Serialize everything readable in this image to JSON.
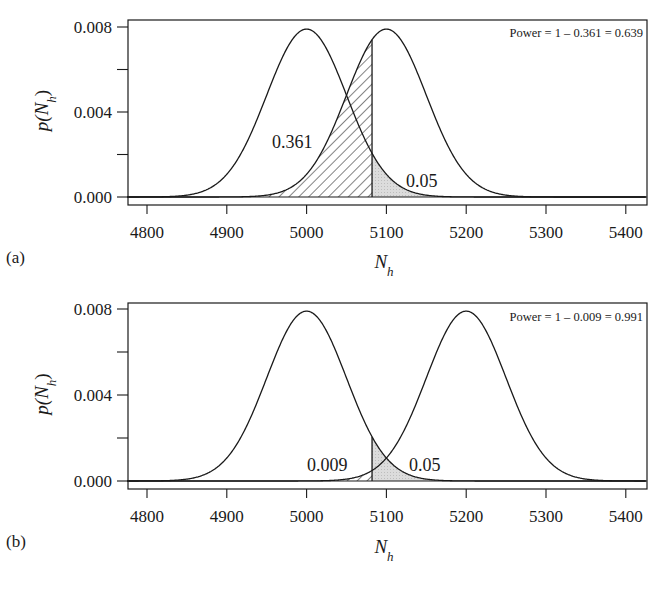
{
  "chart_data": [
    {
      "panel": "a",
      "type": "line",
      "panel_label": "(a)",
      "xlabel": "N_h",
      "xlabel_main": "N",
      "xlabel_sub": "h",
      "ylabel": "p(N_h)",
      "ylabel_main": "p(N",
      "ylabel_sub": "h",
      "ylabel_close": ")",
      "xlim": [
        4775,
        5425
      ],
      "ylim": [
        0.0,
        0.008
      ],
      "xticks": [
        4800,
        4900,
        5000,
        5100,
        5200,
        5300,
        5400
      ],
      "xtick_labels": [
        "4800",
        "4900",
        "5000",
        "5100",
        "5200",
        "5300",
        "5400"
      ],
      "yticks": [
        0.0,
        0.002,
        0.004,
        0.006,
        0.008
      ],
      "ytick_labels": [
        "0.000",
        "",
        "0.004",
        "",
        "0.008"
      ],
      "grid": false,
      "series": [
        {
          "name": "H0 density",
          "distribution": "normal",
          "mean": 5000,
          "sd": 50,
          "peak": 0.0079
        },
        {
          "name": "H1 density",
          "distribution": "normal",
          "mean": 5100,
          "sd": 50,
          "peak": 0.0079
        }
      ],
      "critical_value": 5082,
      "shaded_regions": [
        {
          "name": "beta (type II error)",
          "under": "H1 density",
          "x_from": 4775,
          "x_to": 5082,
          "fill": "hatched",
          "area": 0.361
        },
        {
          "name": "alpha (type I error)",
          "under": "H0 density",
          "x_from": 5082,
          "x_to": 5425,
          "fill": "light-grey-stipple",
          "area": 0.05
        }
      ],
      "annotations": [
        {
          "text": "0.361",
          "x": 5000,
          "y": 0.0026
        },
        {
          "text": "0.05",
          "x": 5130,
          "y": 0.0008
        }
      ],
      "power_text": "Power = 1 – 0.361 = 0.639"
    },
    {
      "panel": "b",
      "type": "line",
      "panel_label": "(b)",
      "xlabel": "N_h",
      "xlabel_main": "N",
      "xlabel_sub": "h",
      "ylabel": "p(N_h)",
      "ylabel_main": "p(N",
      "ylabel_sub": "h",
      "ylabel_close": ")",
      "xlim": [
        4775,
        5425
      ],
      "ylim": [
        0.0,
        0.008
      ],
      "xticks": [
        4800,
        4900,
        5000,
        5100,
        5200,
        5300,
        5400
      ],
      "xtick_labels": [
        "4800",
        "4900",
        "5000",
        "5100",
        "5200",
        "5300",
        "5400"
      ],
      "yticks": [
        0.0,
        0.002,
        0.004,
        0.006,
        0.008
      ],
      "ytick_labels": [
        "0.000",
        "",
        "0.004",
        "",
        "0.008"
      ],
      "grid": false,
      "series": [
        {
          "name": "H0 density",
          "distribution": "normal",
          "mean": 5000,
          "sd": 50,
          "peak": 0.0079
        },
        {
          "name": "H1 density",
          "distribution": "normal",
          "mean": 5200,
          "sd": 50,
          "peak": 0.0079
        }
      ],
      "critical_value": 5082,
      "shaded_regions": [
        {
          "name": "beta (type II error)",
          "under": "H1 density",
          "x_from": 4775,
          "x_to": 5082,
          "fill": "hatched",
          "area": 0.009
        },
        {
          "name": "alpha (type I error)",
          "under": "H0 density",
          "x_from": 5082,
          "x_to": 5425,
          "fill": "light-grey-stipple",
          "area": 0.05
        }
      ],
      "annotations": [
        {
          "text": "0.009",
          "x": 5030,
          "y": 0.0006
        },
        {
          "text": "0.05",
          "x": 5130,
          "y": 0.0006
        }
      ],
      "power_text": "Power = 1 – 0.009 = 0.991"
    }
  ]
}
